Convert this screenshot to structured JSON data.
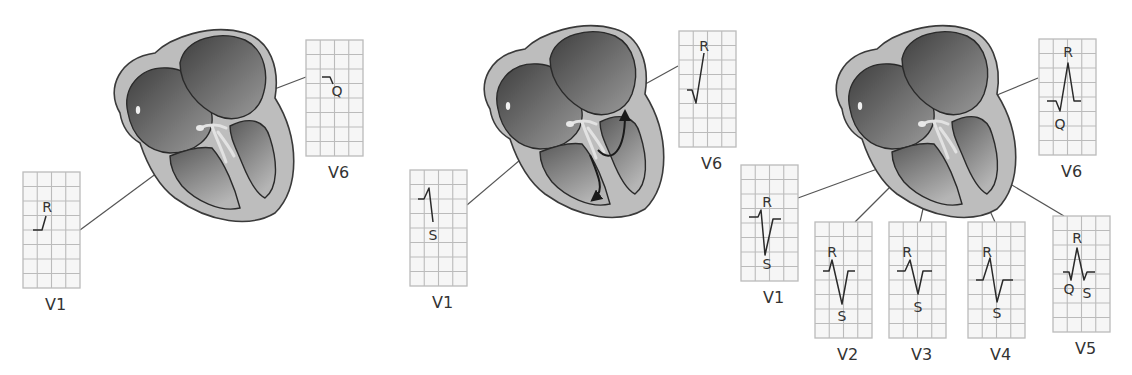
{
  "colors": {
    "background": "#ffffff",
    "heart_wall": "#bdbdbd",
    "heart_outline": "#3a3a3a",
    "chamber_dark": "#4a4a4a",
    "chamber_light": "#a8a8a8",
    "grid_line": "#bbbbbb",
    "grid_bg": "#f6f6f6",
    "trace": "#2a2a2a",
    "connector": "#555555",
    "label": "#333333"
  },
  "panels": [
    {
      "id": "septal-depolarization",
      "has_conduction_arrows": false,
      "leads": [
        {
          "lead": "V1",
          "labels": [
            {
              "text": "R",
              "pos": "r"
            }
          ],
          "trace": "small-r"
        },
        {
          "lead": "V6",
          "labels": [
            {
              "text": "Q",
              "pos": "q"
            }
          ],
          "trace": "small-q"
        }
      ]
    },
    {
      "id": "ventricular-depolarization",
      "has_conduction_arrows": true,
      "leads": [
        {
          "lead": "V1",
          "labels": [
            {
              "text": "S",
              "pos": "s"
            }
          ],
          "trace": "rS"
        },
        {
          "lead": "V6",
          "labels": [
            {
              "text": "R",
              "pos": "r"
            }
          ],
          "trace": "qR"
        }
      ]
    },
    {
      "id": "precordial-progression",
      "has_conduction_arrows": false,
      "leads": [
        {
          "lead": "V1",
          "labels": [
            {
              "text": "R",
              "pos": "r"
            },
            {
              "text": "S",
              "pos": "s"
            }
          ],
          "trace": "rS-deep"
        },
        {
          "lead": "V2",
          "labels": [
            {
              "text": "R",
              "pos": "r"
            },
            {
              "text": "S",
              "pos": "s"
            }
          ],
          "trace": "RS-v2"
        },
        {
          "lead": "V3",
          "labels": [
            {
              "text": "R",
              "pos": "r"
            },
            {
              "text": "S",
              "pos": "s"
            }
          ],
          "trace": "RS-v3"
        },
        {
          "lead": "V4",
          "labels": [
            {
              "text": "R",
              "pos": "r"
            },
            {
              "text": "S",
              "pos": "s"
            }
          ],
          "trace": "RS-v4"
        },
        {
          "lead": "V5",
          "labels": [
            {
              "text": "R",
              "pos": "r"
            },
            {
              "text": "Q",
              "pos": "q"
            },
            {
              "text": "S",
              "pos": "s2"
            }
          ],
          "trace": "qRs"
        },
        {
          "lead": "V6",
          "labels": [
            {
              "text": "R",
              "pos": "r"
            },
            {
              "text": "Q",
              "pos": "q"
            }
          ],
          "trace": "qR-tall"
        }
      ]
    }
  ]
}
